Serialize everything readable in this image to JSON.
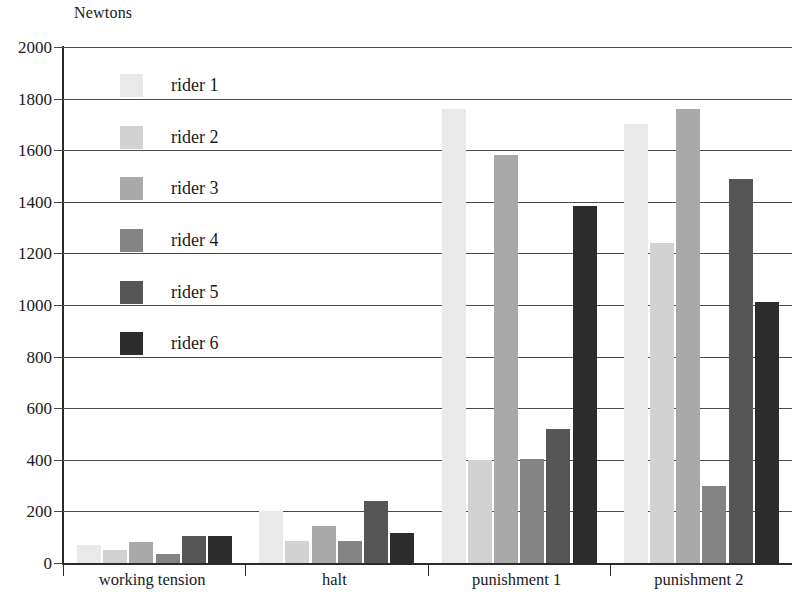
{
  "chart_data": {
    "type": "bar",
    "title": "",
    "ylabel": "Newtons",
    "xlabel": "",
    "ylim": [
      0,
      2000
    ],
    "yticks": [
      0,
      200,
      400,
      600,
      800,
      1000,
      1200,
      1400,
      1600,
      1800,
      2000
    ],
    "ytick_labels": [
      "0",
      "200",
      "400",
      "600",
      "800",
      "1000",
      "1200",
      "1400",
      "1600",
      "1800",
      "2000"
    ],
    "grid": true,
    "legend_position": "upper left inside plot",
    "categories": [
      "working tension",
      "halt",
      "punishment 1",
      "punishment 2"
    ],
    "series": [
      {
        "name": "rider 1",
        "color": "#e9e9e9",
        "values": [
          70,
          200,
          1760,
          1700
        ]
      },
      {
        "name": "rider 2",
        "color": "#d2d2d2",
        "values": [
          50,
          85,
          400,
          1240
        ]
      },
      {
        "name": "rider 3",
        "color": "#a9a9a9",
        "values": [
          80,
          145,
          1580,
          1760
        ]
      },
      {
        "name": "rider 4",
        "color": "#848484",
        "values": [
          35,
          85,
          405,
          300
        ]
      },
      {
        "name": "rider 5",
        "color": "#565656",
        "values": [
          105,
          240,
          520,
          1490
        ]
      },
      {
        "name": "rider 6",
        "color": "#2c2c2c",
        "values": [
          105,
          115,
          1385,
          1010
        ]
      }
    ]
  },
  "axis": {
    "unit_title": "Newtons"
  },
  "legend": {
    "items": [
      {
        "label": "rider 1",
        "color": "#e9e9e9"
      },
      {
        "label": "rider 2",
        "color": "#d2d2d2"
      },
      {
        "label": "rider 3",
        "color": "#a9a9a9"
      },
      {
        "label": "rider 4",
        "color": "#848484"
      },
      {
        "label": "rider 5",
        "color": "#565656"
      },
      {
        "label": "rider 6",
        "color": "#2c2c2c"
      }
    ]
  }
}
